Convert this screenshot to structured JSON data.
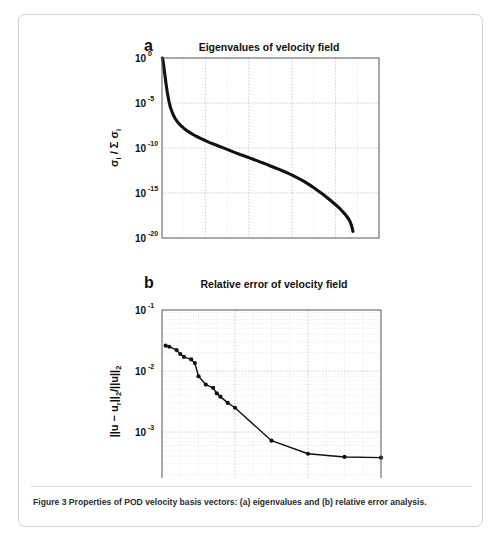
{
  "figure": {
    "caption": "Figure 3 Properties of POD velocity basis vectors: (a) eigenvalues and (b) relative error analysis.",
    "background_color": "#ffffff",
    "border_color": "#d2d2d2",
    "data_color": "#111111"
  },
  "panel_a": {
    "letter": "a",
    "title": "Eigenvalues of velocity field",
    "xlabel": "i",
    "ylabel_main": "σ",
    "ylabel_sub1": "i",
    "ylabel_mid": " / Σ σ",
    "ylabel_sub2": "i",
    "ytick_mantissa": "10",
    "xticks": [
      "0",
      "100",
      "200",
      "300",
      "400",
      "500"
    ],
    "yticks": [
      "0",
      "-5",
      "-10",
      "-15",
      "-20"
    ]
  },
  "panel_b": {
    "letter": "b",
    "title": "Relative error of velocity field",
    "xlabel": "Number of POD modes",
    "ylabel": "||u − u_r||₂/||u||₂",
    "ytick_mantissa": "10",
    "xticks": [
      "0",
      "20",
      "40",
      "60"
    ],
    "yticks": [
      "-1",
      "-2",
      "-3",
      "-4"
    ]
  },
  "chart_data": [
    {
      "type": "line",
      "panel": "a",
      "title": "Eigenvalues of velocity field",
      "xlabel": "i",
      "ylabel": "sigma_i / sum sigma_i",
      "xlim": [
        0,
        500
      ],
      "ylim": [
        1e-20,
        1
      ],
      "yscale": "log",
      "xticks": [
        0,
        100,
        200,
        300,
        400,
        500
      ],
      "yticks": [
        1,
        1e-05,
        1e-10,
        1e-15,
        1e-20
      ],
      "grid": true,
      "legend": null,
      "x": [
        1,
        2,
        3,
        4,
        5,
        6,
        7,
        8,
        9,
        10,
        12,
        14,
        16,
        18,
        20,
        25,
        30,
        35,
        40,
        45,
        50,
        60,
        70,
        80,
        90,
        100,
        110,
        120,
        130,
        140,
        150,
        160,
        170,
        180,
        190,
        200,
        210,
        220,
        230,
        240,
        250,
        260,
        270,
        280,
        290,
        300,
        310,
        320,
        330,
        340,
        350,
        360,
        370,
        380,
        390,
        400,
        410,
        415,
        420,
        425,
        430,
        433,
        436,
        438,
        440
      ],
      "y": [
        1.0,
        0.62,
        0.3,
        0.13,
        0.055,
        0.024,
        0.01,
        0.0042,
        0.0018,
        0.0008,
        0.00018,
        5e-05,
        1.6e-05,
        6e-06,
        2.6e-06,
        6e-07,
        2e-07,
        9e-08,
        4.5e-08,
        2.6e-08,
        1.6e-08,
        7e-09,
        3.5e-09,
        1.9e-09,
        1.1e-09,
        6.5e-10,
        4e-10,
        2.6e-10,
        1.7e-10,
        1.1e-10,
        7e-11,
        4.5e-11,
        2.9e-11,
        1.9e-11,
        1.3e-11,
        8.5e-12,
        5.6e-12,
        3.7e-12,
        2.4e-12,
        1.6e-12,
        1e-12,
        6.5e-13,
        4.2e-13,
        2.6e-13,
        1.6e-13,
        9.5e-14,
        5.5e-14,
        3e-14,
        1.6e-14,
        8e-15,
        3.8e-15,
        1.7e-15,
        7.5e-16,
        3.2e-16,
        1.3e-16,
        5e-17,
        1.8e-17,
        1e-17,
        5.5e-18,
        2.8e-18,
        1.3e-18,
        7e-19,
        3e-19,
        1.4e-19,
        5.5e-20
      ]
    },
    {
      "type": "line",
      "panel": "b",
      "title": "Relative error of velocity field",
      "xlabel": "Number of POD modes",
      "ylabel": "||u - u_r||_2 / ||u||_2",
      "xlim": [
        0,
        60
      ],
      "ylim": [
        0.0001,
        0.1
      ],
      "yscale": "log",
      "xticks": [
        0,
        20,
        40,
        60
      ],
      "yticks": [
        0.1,
        0.01,
        0.001,
        0.0001
      ],
      "grid": true,
      "markers": true,
      "legend": null,
      "x": [
        1,
        2,
        4,
        5,
        6,
        8,
        9,
        10,
        12,
        14,
        15,
        16,
        18,
        20,
        30,
        40,
        50,
        60
      ],
      "y": [
        0.026,
        0.025,
        0.022,
        0.019,
        0.017,
        0.0155,
        0.0135,
        0.0082,
        0.006,
        0.0053,
        0.0043,
        0.0038,
        0.003,
        0.0025,
        0.00072,
        0.00044,
        0.00039,
        0.00038
      ]
    }
  ]
}
